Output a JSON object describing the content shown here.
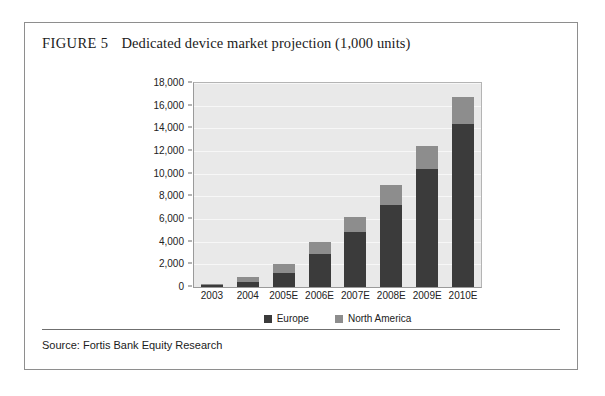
{
  "figure": {
    "label": "FIGURE 5",
    "title": "Dedicated device market projection (1,000 units)",
    "source": "Source: Fortis Bank Equity Research"
  },
  "colors": {
    "europe": "#3b3b3b",
    "north_america": "#8d8d8d",
    "plot_background": "#e9e9e9",
    "gridline": "#f7f7f7",
    "axis": "#6a6a6a",
    "card_border": "#8e8e8e"
  },
  "chart_data": {
    "type": "bar",
    "stacked": true,
    "title": "Dedicated device market projection (1,000 units)",
    "xlabel": "",
    "ylabel": "",
    "ylim": [
      0,
      18000
    ],
    "yticks": [
      0,
      2000,
      4000,
      6000,
      8000,
      10000,
      12000,
      14000,
      16000,
      18000
    ],
    "ytick_labels": [
      "0",
      "2,000",
      "4,000",
      "6,000",
      "8,000",
      "10,000",
      "12,000",
      "14,000",
      "16,000",
      "18,000"
    ],
    "grid": true,
    "legend_position": "bottom",
    "categories": [
      "2003",
      "2004",
      "2005E",
      "2006E",
      "2007E",
      "2008E",
      "2009E",
      "2010E"
    ],
    "series": [
      {
        "name": "Europe",
        "color": "#3b3b3b",
        "values": [
          150,
          400,
          1250,
          2900,
          4850,
          7200,
          10400,
          14400
        ]
      },
      {
        "name": "North America",
        "color": "#8d8d8d",
        "values": [
          100,
          450,
          750,
          1100,
          1350,
          1800,
          2000,
          2400
        ]
      }
    ],
    "totals": [
      250,
      850,
      2000,
      4000,
      6200,
      9000,
      12400,
      16800
    ]
  }
}
